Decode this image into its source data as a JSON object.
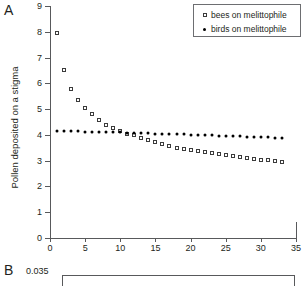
{
  "figure": {
    "panelA_label": "A",
    "panelB_label": "B"
  },
  "chart_data": {
    "type": "scatter",
    "title": "",
    "xlabel": "",
    "ylabel": "Pollen deposited on a stigma",
    "xlim": [
      0,
      35
    ],
    "ylim": [
      0,
      9
    ],
    "xticks": [
      "0",
      "5",
      "10",
      "15",
      "20",
      "25",
      "30",
      "35"
    ],
    "xtick_values": [
      0,
      5,
      10,
      15,
      20,
      25,
      30,
      35
    ],
    "yticks": [
      "0",
      "1",
      "2",
      "3",
      "4",
      "5",
      "6",
      "7",
      "8",
      "9"
    ],
    "ytick_values": [
      0,
      1,
      2,
      3,
      4,
      5,
      6,
      7,
      8,
      9
    ],
    "grid": false,
    "legend_position": "top-right",
    "x": [
      1,
      2,
      3,
      4,
      5,
      6,
      7,
      8,
      9,
      10,
      11,
      12,
      13,
      14,
      15,
      16,
      17,
      18,
      19,
      20,
      21,
      22,
      23,
      24,
      25,
      26,
      27,
      28,
      29,
      30,
      31,
      32,
      33
    ],
    "series": [
      {
        "name": "bees on melittophile",
        "marker": "open-square",
        "color": "#3b3b3b",
        "values": [
          7.95,
          6.52,
          5.79,
          5.35,
          5.05,
          4.8,
          4.57,
          4.39,
          4.25,
          4.14,
          4.05,
          3.98,
          3.86,
          3.79,
          3.71,
          3.63,
          3.56,
          3.5,
          3.45,
          3.4,
          3.36,
          3.32,
          3.28,
          3.24,
          3.21,
          3.17,
          3.13,
          3.1,
          3.07,
          3.04,
          3.01,
          2.98,
          2.96
        ]
      },
      {
        "name": "birds on melittophile",
        "marker": "filled-circle",
        "color": "#000000",
        "values": [
          4.15,
          4.15,
          4.14,
          4.14,
          4.13,
          4.13,
          4.12,
          4.12,
          4.11,
          4.11,
          4.08,
          4.07,
          4.07,
          4.06,
          4.05,
          4.04,
          4.03,
          4.03,
          4.02,
          4.01,
          4.0,
          3.99,
          3.98,
          3.97,
          3.96,
          3.95,
          3.94,
          3.93,
          3.92,
          3.91,
          3.9,
          3.89,
          3.88
        ]
      }
    ]
  },
  "legend": {
    "entries": [
      {
        "label": "bees on melittophile",
        "marker": "open-square"
      },
      {
        "label": "birds on melittophile",
        "marker": "filled-circle"
      }
    ]
  },
  "panelB": {
    "ytop_label": "0.035"
  }
}
